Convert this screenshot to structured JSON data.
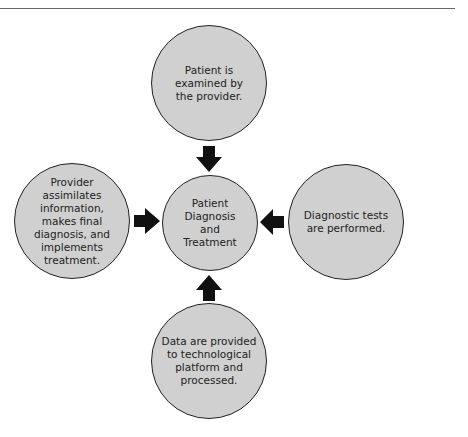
{
  "diagram": {
    "center": {
      "label": "Patient\nDiagnosis\nand\nTreatment"
    },
    "top": {
      "label": "Patient is\nexamined by\nthe provider."
    },
    "right": {
      "label": "Diagnostic tests\nare performed."
    },
    "bottom": {
      "label": "Data are provided\nto technological\nplatform and\nprocessed."
    },
    "left": {
      "label": "Provider\nassimilates\ninformation,\nmakes final\ndiagnosis, and\nimplements\ntreatment."
    },
    "arrows": [
      "top-to-center",
      "right-to-center",
      "bottom-to-center",
      "left-to-center"
    ],
    "colors": {
      "circle_fill": "#d0d0d0",
      "border": "#222222",
      "arrow": "#111111"
    }
  }
}
